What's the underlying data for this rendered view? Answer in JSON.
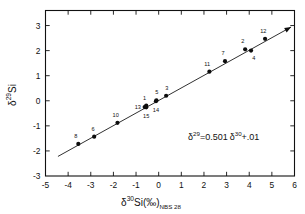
{
  "chart_data": {
    "type": "scatter",
    "title": "",
    "xlabel": "δ³⁰Si(‰)NBS 28",
    "ylabel": "δ²⁹Si",
    "xlim": [
      -5,
      6
    ],
    "ylim": [
      -3,
      3.6
    ],
    "xticks": [
      -5,
      -4,
      -3,
      -2,
      -1,
      0,
      1,
      2,
      3,
      4,
      5,
      6
    ],
    "yticks": [
      -3,
      -2,
      -1,
      0,
      1,
      2,
      3
    ],
    "xticklabels": [
      "-5",
      "-4",
      "-3",
      "-2",
      "-1",
      "0",
      "1",
      "2",
      "3",
      "4",
      "5",
      "6"
    ],
    "yticklabels": [
      "-3",
      "-2",
      "-1",
      "0",
      "1",
      "2",
      "3"
    ],
    "grid": false,
    "legend": false,
    "annotation": "δ²⁹ = 0.501 δ³⁰ + .01",
    "fit_slope": 0.501,
    "fit_intercept": 0.01,
    "fit_line_x": [
      -4.45,
      5.85
    ],
    "points": [
      {
        "label": "1",
        "x": -0.55,
        "y": -0.19,
        "lx": -0.62,
        "ly": 0.13,
        "anchor": "middle"
      },
      {
        "label": "2",
        "x": 3.82,
        "y": 2.05,
        "lx": 3.72,
        "ly": 2.38,
        "anchor": "middle"
      },
      {
        "label": "3",
        "x": 0.33,
        "y": 0.2,
        "lx": 0.36,
        "ly": 0.52,
        "anchor": "middle"
      },
      {
        "label": "4",
        "x": 4.08,
        "y": 2.0,
        "lx": 4.2,
        "ly": 1.72,
        "anchor": "middle"
      },
      {
        "label": "5",
        "x": -0.1,
        "y": 0.02,
        "lx": -0.08,
        "ly": 0.35,
        "anchor": "middle"
      },
      {
        "label": "6",
        "x": -2.85,
        "y": -1.43,
        "lx": -2.9,
        "ly": -1.11,
        "anchor": "middle"
      },
      {
        "label": "7",
        "x": 2.93,
        "y": 1.58,
        "lx": 2.84,
        "ly": 1.9,
        "anchor": "middle"
      },
      {
        "label": "8",
        "x": -3.55,
        "y": -1.72,
        "lx": -3.66,
        "ly": -1.4,
        "anchor": "middle"
      },
      {
        "label": "10",
        "x": -1.82,
        "y": -0.88,
        "lx": -1.9,
        "ly": -0.56,
        "anchor": "middle"
      },
      {
        "label": "11",
        "x": 2.24,
        "y": 1.16,
        "lx": 2.14,
        "ly": 1.48,
        "anchor": "middle"
      },
      {
        "label": "12",
        "x": 4.7,
        "y": 2.47,
        "lx": 4.62,
        "ly": 2.78,
        "anchor": "middle"
      },
      {
        "label": "13",
        "x": -0.62,
        "y": -0.25,
        "lx": -0.92,
        "ly": -0.26,
        "anchor": "middle"
      },
      {
        "label": "14",
        "x": -0.12,
        "y": -0.02,
        "lx": -0.12,
        "ly": -0.35,
        "anchor": "middle"
      },
      {
        "label": "15",
        "x": -0.55,
        "y": -0.26,
        "lx": -0.55,
        "ly": -0.62,
        "anchor": "middle"
      }
    ]
  },
  "axes": {
    "x_title_parts": {
      "delta": "δ",
      "sup": "30",
      "si": "Si(‰)",
      "sub": "NBS 28"
    },
    "y_title_parts": {
      "delta": "δ",
      "sup": "29",
      "si": "Si"
    }
  },
  "equation": {
    "lhs_delta": "δ",
    "lhs_sup": "29",
    "mid": "=0.501",
    "rhs_delta": "δ",
    "rhs_sup": "30",
    "tail": "+.01"
  }
}
